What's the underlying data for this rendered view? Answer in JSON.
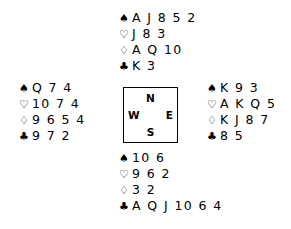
{
  "diagram": {
    "type": "bridge-deal",
    "suit_symbols": {
      "spades": "♠",
      "hearts": "♡",
      "diamonds": "♢",
      "clubs": "♣"
    },
    "compass": {
      "north": "N",
      "south": "S",
      "west": "W",
      "east": "E"
    },
    "hands": {
      "north": {
        "label": "North",
        "suits": [
          {
            "symbol": "♠",
            "name": "spades-symbol",
            "cards": "A J 8 5 2"
          },
          {
            "symbol": "♡",
            "name": "hearts-symbol",
            "cards": "J 8 3"
          },
          {
            "symbol": "♢",
            "name": "diamonds-symbol",
            "cards": "A Q 10"
          },
          {
            "symbol": "♣",
            "name": "clubs-symbol",
            "cards": "K 3"
          }
        ]
      },
      "west": {
        "label": "West",
        "suits": [
          {
            "symbol": "♠",
            "name": "spades-symbol",
            "cards": "Q 7 4"
          },
          {
            "symbol": "♡",
            "name": "hearts-symbol",
            "cards": "10 7 4"
          },
          {
            "symbol": "♢",
            "name": "diamonds-symbol",
            "cards": "9 6 5 4"
          },
          {
            "symbol": "♣",
            "name": "clubs-symbol",
            "cards": "9 7 2"
          }
        ]
      },
      "east": {
        "label": "East",
        "suits": [
          {
            "symbol": "♠",
            "name": "spades-symbol",
            "cards": "K 9 3"
          },
          {
            "symbol": "♡",
            "name": "hearts-symbol",
            "cards": "A K Q 5"
          },
          {
            "symbol": "♢",
            "name": "diamonds-symbol",
            "cards": "K J 8 7"
          },
          {
            "symbol": "♣",
            "name": "clubs-symbol",
            "cards": "8 5"
          }
        ]
      },
      "south": {
        "label": "South",
        "suits": [
          {
            "symbol": "♠",
            "name": "spades-symbol",
            "cards": "10 6"
          },
          {
            "symbol": "♡",
            "name": "hearts-symbol",
            "cards": "9 6 2"
          },
          {
            "symbol": "♢",
            "name": "diamonds-symbol",
            "cards": "3 2"
          },
          {
            "symbol": "♣",
            "name": "clubs-symbol",
            "cards": "A Q J 10 6 4"
          }
        ]
      }
    },
    "colors": {
      "ink": "#000000",
      "background": "#ffffff"
    }
  }
}
